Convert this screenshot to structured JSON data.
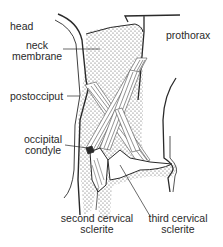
{
  "diagram": {
    "labels": {
      "head": "head",
      "neck_membrane_1": "neck",
      "neck_membrane_2": "membrane",
      "prothorax": "prothorax",
      "postocciput": "postocciput",
      "occipital_condyle_1": "occipital",
      "occipital_condyle_2": "condyle",
      "second_cervical_1": "second cervical",
      "second_cervical_2": "sclerite",
      "third_cervical_1": "third cervical",
      "third_cervical_2": "sclerite"
    },
    "colors": {
      "line": "#2a2a2a",
      "stipple": "#555555",
      "muscle": "#4a4a4a",
      "background": "#ffffff"
    }
  }
}
